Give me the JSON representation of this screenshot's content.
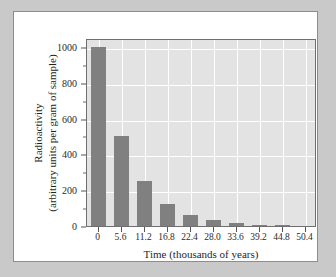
{
  "chart_data": {
    "type": "bar",
    "title": "",
    "subtitle": "",
    "xlabel": "Time (thousands of years)",
    "ylabel_line1": "Radioactivity",
    "ylabel_line2": "(arbitrary units per gram of sample)",
    "categories": [
      "0",
      "5.6",
      "11.2",
      "16.8",
      "22.4",
      "28.0",
      "33.6",
      "39.2",
      "44.8",
      "50.4"
    ],
    "values": [
      1000,
      500,
      250,
      125,
      62.5,
      31.25,
      15.6,
      7.8,
      3.9,
      2
    ],
    "x": [
      0,
      5.6,
      11.2,
      16.8,
      22.4,
      28.0,
      33.6,
      39.2,
      44.8,
      50.4
    ],
    "ylim": [
      0,
      1050
    ],
    "xlim": [
      -2.8,
      53.2
    ],
    "yticks": [
      0,
      200,
      400,
      600,
      800,
      1000
    ],
    "ytick_labels": [
      "0",
      "200",
      "400",
      "600",
      "800",
      "1000"
    ],
    "yminor_ticks": [
      100,
      300,
      500,
      700,
      900
    ],
    "xtick_labels": [
      "0",
      "5.6",
      "11.2",
      "16.8",
      "22.4",
      "28.0",
      "33.6",
      "39.2",
      "44.8",
      "50.4"
    ],
    "grid": true,
    "gridline_color": "#ffffff",
    "legend": "none",
    "bar_color": "#808080",
    "plot_background": "#e3e3e3",
    "figure_background": "#ffffff",
    "page_background": "#c9c9c9",
    "axis_color": "#6f6f6f"
  }
}
